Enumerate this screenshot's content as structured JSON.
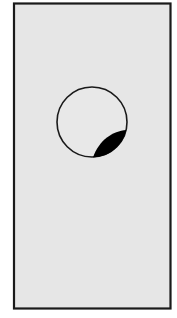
{
  "figure": {
    "colors": {
      "background": "#ffffff",
      "panel_fill": "#e6e6e6",
      "border": "#1a1a1a",
      "circle_fill": "#e8e8e8",
      "crescent_fill": "#000000"
    },
    "rectangle": {
      "x": 14,
      "y": 3,
      "width": 157,
      "height": 306
    },
    "circle": {
      "cx": 92,
      "cy": 122,
      "r": 35
    },
    "crescent": {
      "start": [
        93,
        158
      ],
      "end": [
        126,
        130
      ]
    }
  }
}
